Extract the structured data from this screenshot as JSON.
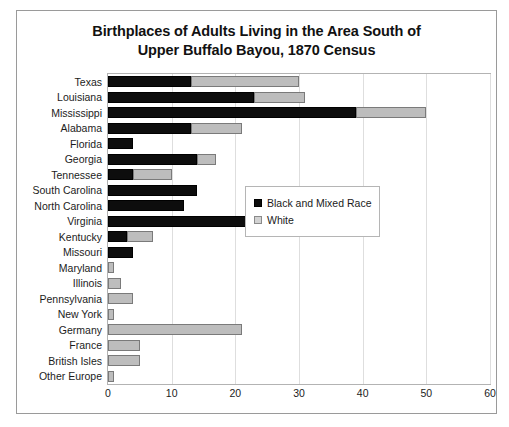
{
  "chart_data": {
    "type": "bar",
    "orientation": "horizontal",
    "stacked": true,
    "title": "Birthplaces of Adults Living in the Area South of Upper Buffalo Bayou, 1870 Census",
    "title_lines": [
      "Birthplaces of Adults Living in the Area South of",
      "Upper Buffalo Bayou, 1870 Census"
    ],
    "xlabel": "",
    "ylabel": "",
    "xlim": [
      0,
      60
    ],
    "xticks": [
      0,
      10,
      20,
      30,
      40,
      50,
      60
    ],
    "grid": true,
    "legend_position": "middle-right",
    "categories": [
      "Texas",
      "Louisiana",
      "Mississippi",
      "Alabama",
      "Florida",
      "Georgia",
      "Tennessee",
      "South Carolina",
      "North Carolina",
      "Virginia",
      "Kentucky",
      "Missouri",
      "Maryland",
      "Illinois",
      "Pennsylvania",
      "New York",
      "Germany",
      "France",
      "British Isles",
      "Other Europe"
    ],
    "series": [
      {
        "name": "Black and Mixed Race",
        "color": "#0d0d0d",
        "values": [
          13,
          23,
          39,
          13,
          4,
          14,
          4,
          14,
          12,
          23,
          3,
          4,
          0,
          0,
          0,
          0,
          0,
          0,
          0,
          0
        ]
      },
      {
        "name": "White",
        "color": "#bdbdbd",
        "values": [
          17,
          8,
          11,
          8,
          0,
          3,
          6,
          0,
          0,
          9,
          4,
          0,
          1,
          2,
          4,
          1,
          21,
          5,
          5,
          1
        ]
      }
    ],
    "totals": [
      30,
      31,
      50,
      21,
      4,
      17,
      10,
      14,
      12,
      32,
      7,
      4,
      1,
      2,
      4,
      1,
      21,
      5,
      5,
      1
    ]
  },
  "legend": {
    "items": [
      {
        "label": "Black and Mixed Race",
        "swatch": "black"
      },
      {
        "label": "White",
        "swatch": "white"
      }
    ]
  },
  "watermark": {
    "text": ""
  }
}
